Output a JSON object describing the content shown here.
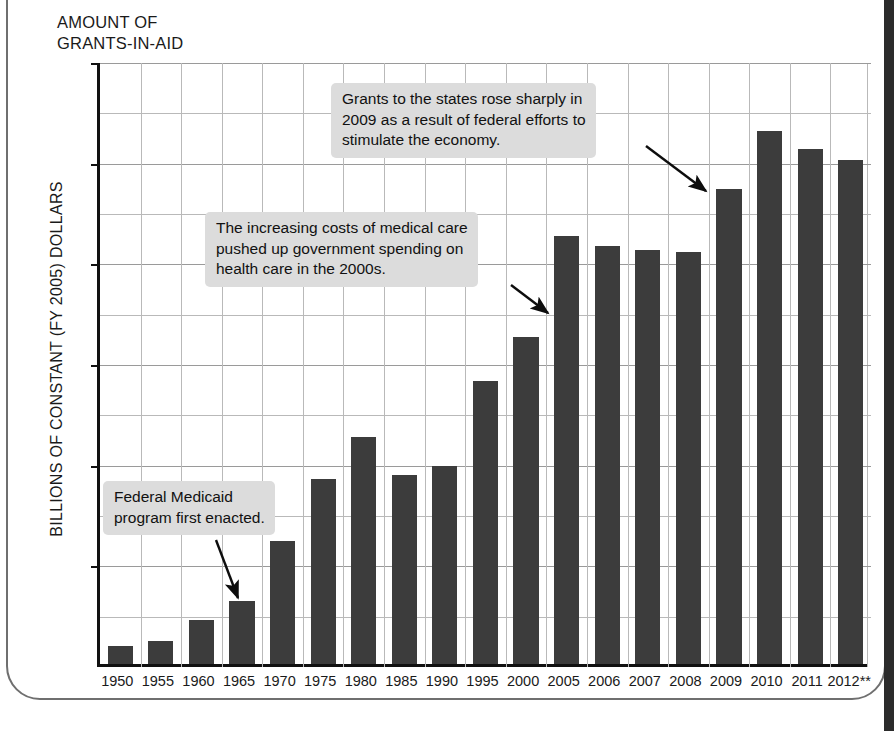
{
  "figure": {
    "title": "AMOUNT OF\nGRANTS-IN-AID",
    "y_axis_title": "BILLIONS OF CONSTANT (FY 2005) DOLLARS",
    "bar_color": "#3c3c3c",
    "callout_bg": "#dcdcdc",
    "grid_color": "#b9b9b9",
    "axis_color": "#111111"
  },
  "annotations": [
    {
      "name": "callout-2009",
      "text": "Grants to the states rose sharply in\n2009 as a result of federal efforts to\nstimulate the economy.",
      "points_at": "2009"
    },
    {
      "name": "callout-health",
      "text": "The increasing costs of medical care\npushed up government spending on\nhealth care in the 2000s.",
      "points_at": "2005"
    },
    {
      "name": "callout-medicaid",
      "text": "Federal Medicaid\nprogram first enacted.",
      "points_at": "1965"
    }
  ],
  "chart_data": {
    "type": "bar",
    "title": "AMOUNT OF GRANTS-IN-AID",
    "xlabel": "",
    "ylabel": "BILLIONS OF CONSTANT (FY 2005) DOLLARS",
    "ylim": [
      0,
      600
    ],
    "yticks": [
      0,
      100,
      200,
      300,
      400,
      500,
      600
    ],
    "ytick_labels": [
      "0",
      "100",
      "200",
      "300",
      "400",
      "500",
      "600"
    ],
    "minor_gridlines": [
      50,
      150,
      250,
      350,
      450,
      550
    ],
    "grid": true,
    "legend": "none",
    "categories": [
      "1950",
      "1955",
      "1960",
      "1965",
      "1970",
      "1975",
      "1980",
      "1985",
      "1990",
      "1995",
      "2000",
      "2005",
      "2006",
      "2007",
      "2008",
      "2009",
      "2010",
      "2011",
      "2012**"
    ],
    "values": [
      18,
      23,
      44,
      63,
      122,
      184,
      226,
      188,
      197,
      281,
      325,
      425,
      415,
      411,
      409,
      472,
      529,
      512,
      501
    ],
    "footnote_marker": "**"
  }
}
